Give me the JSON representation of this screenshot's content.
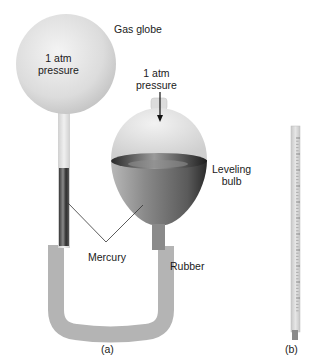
{
  "figure": {
    "panel_a": {
      "caption": "(a)",
      "gas_globe": {
        "label": "Gas globe",
        "inner_text_line1": "1 atm",
        "inner_text_line2": "pressure"
      },
      "leveling_bulb": {
        "label_line1": "Leveling",
        "label_line2": "bulb"
      },
      "top_pressure": {
        "line1": "1 atm",
        "line2": "pressure"
      },
      "mercury_label": "Mercury",
      "rubber_label": "Rubber"
    },
    "panel_b": {
      "caption": "(b)",
      "item": "graduated tube"
    },
    "colors": {
      "glass": "#e3e3e3",
      "mercury": "#6e6e6e",
      "rubber": "#b4b4b4",
      "text": "#1a1a1a"
    }
  }
}
